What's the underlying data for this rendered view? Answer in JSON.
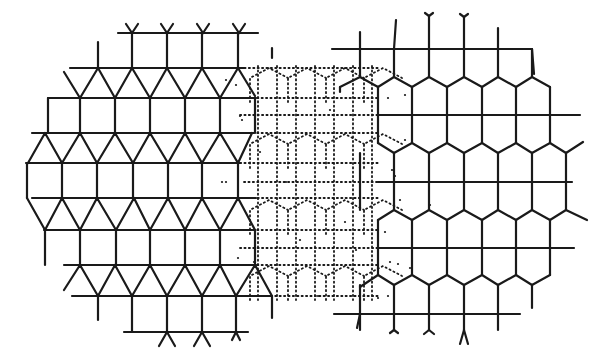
{
  "figure": {
    "width": 596,
    "height": 358,
    "background": "#ffffff",
    "ink": "#1a1a1a"
  },
  "left_lattice": {
    "type": "triangle-square tiling",
    "rows_y": [
      33,
      68,
      98,
      133,
      163,
      198,
      230,
      265,
      296,
      332
    ],
    "row_extents": [
      [
        118,
        258
      ],
      [
        70,
        240
      ],
      [
        48,
        255
      ],
      [
        32,
        252
      ],
      [
        26,
        240
      ],
      [
        32,
        255
      ],
      [
        44,
        252
      ],
      [
        64,
        255
      ],
      [
        72,
        272
      ],
      [
        124,
        248
      ]
    ],
    "column_spacing": 35
  },
  "transition_region": {
    "style": "dotted",
    "x_range": [
      228,
      395
    ],
    "y_range": [
      45,
      320
    ]
  },
  "right_lattice": {
    "type": "elongated hexagon honeycomb",
    "rows_y": [
      49,
      115,
      182,
      248,
      314
    ],
    "row_extents": [
      [
        332,
        532
      ],
      [
        378,
        580
      ],
      [
        378,
        572
      ],
      [
        378,
        574
      ],
      [
        334,
        520
      ]
    ],
    "column_spacing": 35
  }
}
